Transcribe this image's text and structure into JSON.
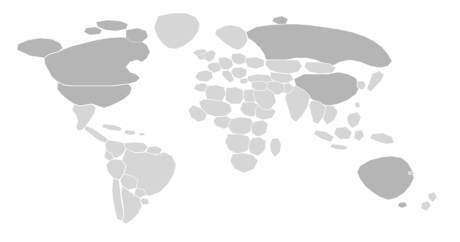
{
  "figure": {
    "kind": "world-map",
    "width": 460,
    "height": 242,
    "background_color": "#ffffff",
    "projection": "equirectangular",
    "has_visible_text": false,
    "has_legend": false,
    "has_graticule": false,
    "antarctica_shown": false
  },
  "style": {
    "land_color": "#d6d6d6",
    "highlight_color": "#b5b5b5",
    "border_color": "#ffffff",
    "border_width": 0.55,
    "ocean_color": "#ffffff"
  },
  "legend_categories": [
    {
      "key": "default",
      "label": "Other countries",
      "color": "#d6d6d6"
    },
    {
      "key": "highlighted",
      "label": "Highlighted countries",
      "color": "#b5b5b5"
    }
  ],
  "highlighted_regions": [
    "United States",
    "Canada",
    "Russia",
    "China",
    "Australia"
  ],
  "regions": [
    {
      "id": "north-america",
      "label": "North America"
    },
    {
      "id": "south-america",
      "label": "South America"
    },
    {
      "id": "europe",
      "label": "Europe"
    },
    {
      "id": "africa",
      "label": "Africa"
    },
    {
      "id": "asia",
      "label": "Asia"
    },
    {
      "id": "oceania",
      "label": "Oceania"
    }
  ]
}
